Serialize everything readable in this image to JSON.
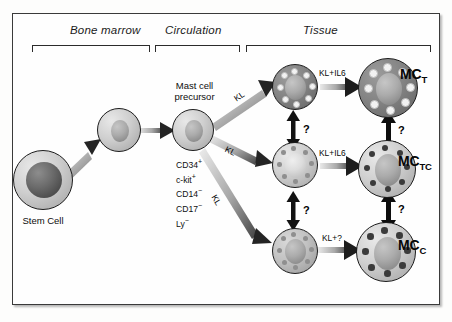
{
  "figure": {
    "title_absent": true,
    "sections": [
      {
        "id": "bone-marrow",
        "label": "Bone marrow"
      },
      {
        "id": "circulation",
        "label": "Circulation"
      },
      {
        "id": "tissue",
        "label": "Tissue"
      }
    ],
    "cells": {
      "stem_cell": {
        "label": "Stem Cell"
      },
      "progenitor": {
        "label": ""
      },
      "mast_cell_precursor": {
        "label_line1": "Mast cell",
        "label_line2": "precursor"
      },
      "immature_t": {
        "label": ""
      },
      "immature_tc": {
        "label": ""
      },
      "immature_c": {
        "label": ""
      },
      "mature_t": {
        "label": "MC",
        "subscript": "T"
      },
      "mature_tc": {
        "label": "MC",
        "subscript": "TC"
      },
      "mature_c": {
        "label": "MC",
        "subscript": "C"
      }
    },
    "markers": [
      {
        "name": "CD34",
        "sign": "+"
      },
      {
        "name": "c-kit",
        "sign": "+"
      },
      {
        "name": "CD14",
        "sign": "−"
      },
      {
        "name": "CD17",
        "sign": "−"
      },
      {
        "name": "Ly",
        "sign": "−"
      }
    ],
    "arrow_labels": {
      "kl_top": "KL",
      "kl_mid": "KL",
      "kl_bot": "KL",
      "klil6_top": "KL+IL6",
      "klil6_mid": "KL+IL6",
      "klq_bot": "KL+?"
    },
    "question_marks": {
      "left_upper": "?",
      "left_lower": "?",
      "right_upper": "?",
      "right_lower": "?"
    },
    "colors": {
      "frame": "#3a3a3a",
      "ink": "#111111",
      "arrow": "#1c1c1c",
      "granule_light": "#f2f2f2",
      "granule_dark": "#3b3b3b"
    }
  }
}
